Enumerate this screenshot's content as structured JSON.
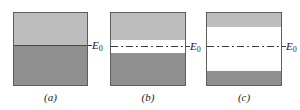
{
  "figure": {
    "type": "physics-band-occupancy-diagram",
    "background": "#ffffff",
    "colors": {
      "light_gray": "#bdbdbd",
      "dark_gray": "#8f8f8f",
      "line": "#3a3a3a",
      "border": "#5d5d5d",
      "text": "#1a1a1a"
    },
    "level_label_text": "E",
    "level_label_subscript": "0"
  },
  "panels": [
    {
      "id": "a",
      "caption": "(a)",
      "level_label": "E",
      "level_subscript": "0",
      "level_line_style": "solid",
      "bands": [
        {
          "name": "upper-light-band",
          "fill": "light_gray",
          "top_pct": 0,
          "height_pct": 45
        },
        {
          "name": "lower-dark-band",
          "fill": "dark_gray",
          "top_pct": 45,
          "height_pct": 55
        }
      ],
      "level_pct": 45
    },
    {
      "id": "b",
      "caption": "(b)",
      "level_label": "E",
      "level_subscript": "0",
      "level_line_style": "dash-dot",
      "bands": [
        {
          "name": "upper-light-band",
          "fill": "light_gray",
          "top_pct": 0,
          "height_pct": 38
        },
        {
          "name": "middle-white-gap",
          "fill": "white",
          "top_pct": 38,
          "height_pct": 17
        },
        {
          "name": "lower-dark-band",
          "fill": "dark_gray",
          "top_pct": 55,
          "height_pct": 45
        }
      ],
      "level_pct": 46
    },
    {
      "id": "c",
      "caption": "(c)",
      "level_label": "E",
      "level_subscript": "0",
      "level_line_style": "dash-dot",
      "bands": [
        {
          "name": "upper-light-band",
          "fill": "light_gray",
          "top_pct": 0,
          "height_pct": 19
        },
        {
          "name": "middle-white-gap",
          "fill": "white",
          "top_pct": 19,
          "height_pct": 61
        },
        {
          "name": "lower-dark-band",
          "fill": "dark_gray",
          "top_pct": 80,
          "height_pct": 20
        }
      ],
      "level_pct": 46
    }
  ]
}
